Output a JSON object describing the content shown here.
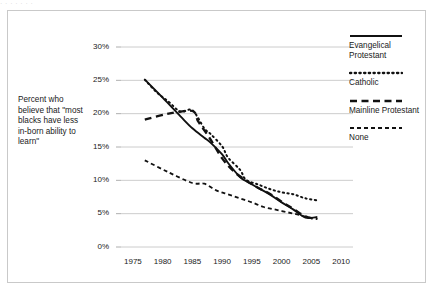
{
  "figure": {
    "top_cut_text": "· · ·   · ·        · ·",
    "caption": "Percent who believe that \"most blacks have less in-born ability to learn\""
  },
  "legend": {
    "position": "right",
    "entries": [
      {
        "label": "Evangelical Protestant",
        "style": "solid",
        "swatch_name": "solid-line-swatch"
      },
      {
        "label": "Catholic",
        "style": "dotted",
        "swatch_name": "dotted-line-swatch"
      },
      {
        "label": "Mainline Protestant",
        "style": "long-dash",
        "swatch_name": "long-dash-line-swatch"
      },
      {
        "label": "None",
        "style": "short-dash",
        "swatch_name": "short-dash-line-swatch"
      }
    ]
  },
  "chart_data": {
    "type": "line",
    "title": "",
    "subtitle": "",
    "xlabel": "",
    "ylabel": "Percent who believe that \"most blacks have less in-born ability to learn\"",
    "xlim": [
      1973,
      2012
    ],
    "ylim": [
      0,
      30
    ],
    "grid": true,
    "grid_axis": "y",
    "legend_position": "right",
    "xticks": [
      1975,
      1980,
      1985,
      1990,
      1995,
      2000,
      2005,
      2010
    ],
    "xtick_labels": [
      "1975",
      "1980",
      "1985",
      "1990",
      "1995",
      "2000",
      "2005",
      "2010"
    ],
    "yticks": [
      0,
      5,
      10,
      15,
      20,
      25,
      30
    ],
    "ytick_labels": [
      "0%",
      "5%",
      "10%",
      "15%",
      "20%",
      "25%",
      "30%"
    ],
    "series": [
      {
        "name": "Evangelical Protestant",
        "style": "solid",
        "color": "#111111",
        "x": [
          1977,
          1980,
          1983,
          1985,
          1987,
          1988,
          1990,
          1991,
          1993,
          1994,
          1996,
          1998,
          2000,
          2002,
          2004,
          2006
        ],
        "values": [
          25.1,
          22.4,
          19.6,
          17.8,
          16.4,
          15.7,
          13.9,
          12.6,
          10.5,
          9.9,
          8.9,
          7.9,
          6.7,
          5.6,
          4.4,
          4.5
        ]
      },
      {
        "name": "Catholic",
        "style": "dotted",
        "color": "#111111",
        "x": [
          1977,
          1979,
          1981,
          1983,
          1985,
          1987,
          1988,
          1990,
          1991,
          1993,
          1994,
          1996,
          1998,
          2000,
          2002,
          2004,
          2006
        ],
        "values": [
          25.1,
          23.2,
          21.8,
          20.3,
          20.5,
          17.8,
          17.0,
          15.1,
          13.4,
          11.6,
          10.1,
          9.4,
          8.7,
          8.2,
          7.9,
          7.3,
          7.0
        ]
      },
      {
        "name": "Mainline Protestant",
        "style": "long-dash",
        "color": "#111111",
        "x": [
          1977,
          1981,
          1985,
          1986,
          1988,
          1990,
          1992,
          1994,
          1996,
          1998,
          2000,
          2002,
          2004,
          2006
        ],
        "values": [
          19.1,
          20.0,
          20.4,
          18.8,
          16.2,
          13.3,
          11.3,
          10.0,
          8.9,
          8.0,
          6.8,
          5.7,
          4.6,
          4.2
        ]
      },
      {
        "name": "None",
        "style": "short-dash",
        "color": "#111111",
        "x": [
          1977,
          1981,
          1985,
          1987,
          1989,
          1991,
          1993,
          1995,
          1997,
          1999,
          2001,
          2003,
          2005,
          2006
        ],
        "values": [
          13.0,
          11.2,
          9.6,
          9.5,
          8.5,
          7.9,
          7.3,
          6.7,
          6.0,
          5.6,
          5.2,
          4.8,
          4.3,
          4.2
        ]
      }
    ]
  }
}
